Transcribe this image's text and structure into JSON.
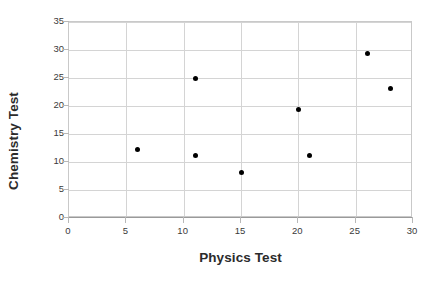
{
  "chart_data": {
    "type": "scatter",
    "title": "",
    "xlabel": "Physics Test",
    "ylabel": "Chemistry Test",
    "xlim": [
      0,
      30
    ],
    "ylim": [
      0,
      35
    ],
    "xticks": [
      0,
      5,
      10,
      15,
      20,
      25,
      30
    ],
    "yticks": [
      0,
      5,
      10,
      15,
      20,
      25,
      30,
      35
    ],
    "grid": true,
    "legend": "none",
    "marker_color": "#000000",
    "grid_color": "#d4d4d4",
    "points": [
      {
        "x": 6,
        "y": 12.2
      },
      {
        "x": 11,
        "y": 25.0
      },
      {
        "x": 11,
        "y": 11.2
      },
      {
        "x": 15,
        "y": 8.1
      },
      {
        "x": 20,
        "y": 19.3
      },
      {
        "x": 21,
        "y": 11.2
      },
      {
        "x": 26,
        "y": 29.4
      },
      {
        "x": 28,
        "y": 23.1
      }
    ]
  }
}
